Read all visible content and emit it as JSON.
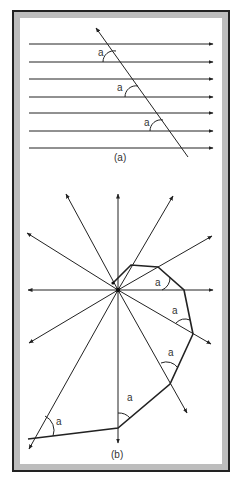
{
  "figure": {
    "panel_a": {
      "caption": "(a)",
      "description": "Seven parallel horizontal arrows crossed by a transversal; equal angles labeled a",
      "angle_label": "a",
      "parallel_line_ys": [
        44,
        62,
        79,
        97,
        113,
        131,
        148
      ],
      "transversal": {
        "from": [
          188,
          157
        ],
        "to": [
          96,
          28
        ]
      },
      "angle_labels": [
        {
          "text": "a",
          "x": 98,
          "y": 56
        },
        {
          "text": "a",
          "x": 117,
          "y": 91
        },
        {
          "text": "a",
          "x": 144,
          "y": 126
        }
      ]
    },
    "panel_b": {
      "caption": "(b)",
      "description": "Radiating arrows from a central point forming a polygon with equal exterior angles labeled a",
      "center": [
        118,
        290
      ],
      "arrow_tips": [
        [
          27,
          233
        ],
        [
          66,
          194
        ],
        [
          118,
          194
        ],
        [
          173,
          196
        ],
        [
          212,
          236
        ],
        [
          213,
          290
        ],
        [
          211,
          344
        ],
        [
          187,
          413
        ],
        [
          118,
          443
        ],
        [
          29,
          449
        ],
        [
          29,
          343
        ],
        [
          28,
          290
        ]
      ],
      "polygon": [
        [
          113,
          283
        ],
        [
          131,
          265
        ],
        [
          158,
          267
        ],
        [
          184,
          290
        ],
        [
          193,
          334
        ],
        [
          170,
          384
        ],
        [
          118,
          428
        ],
        [
          28,
          439
        ]
      ],
      "angle_labels": [
        {
          "text": "a",
          "x": 157,
          "y": 286
        },
        {
          "text": "a",
          "x": 173,
          "y": 314
        },
        {
          "text": "a",
          "x": 173,
          "y": 356
        },
        {
          "text": "a",
          "x": 131,
          "y": 402
        },
        {
          "text": "a",
          "x": 57,
          "y": 424
        }
      ]
    },
    "colors": {
      "line": "#222222",
      "frame_band": "#bdbdbd",
      "background": "#ffffff"
    }
  }
}
